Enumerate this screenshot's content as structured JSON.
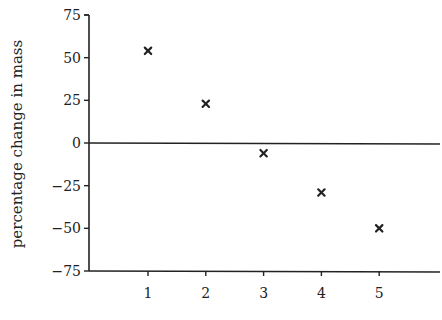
{
  "chart_data": {
    "type": "scatter",
    "title": "",
    "xlabel": "",
    "ylabel": "percentage change in mass",
    "x": [
      1,
      2,
      3,
      4,
      5
    ],
    "series": [
      {
        "name": "percentage change in mass",
        "marker": "x",
        "values": [
          54,
          23,
          -6,
          -29,
          -50
        ]
      }
    ],
    "xlim": [
      0,
      6
    ],
    "ylim": [
      -75,
      75
    ],
    "xticks": [
      1,
      2,
      3,
      4,
      5
    ],
    "xtick_labels": [
      "1",
      "2",
      "3",
      "4",
      "5"
    ],
    "yticks": [
      75,
      50,
      25,
      0,
      -25,
      -50,
      -75
    ],
    "ytick_labels": [
      "75",
      "50",
      "25",
      "0",
      "−25",
      "−50",
      "−75"
    ],
    "zero_line": true,
    "grid": false,
    "legend": "none",
    "color": "#222222"
  }
}
